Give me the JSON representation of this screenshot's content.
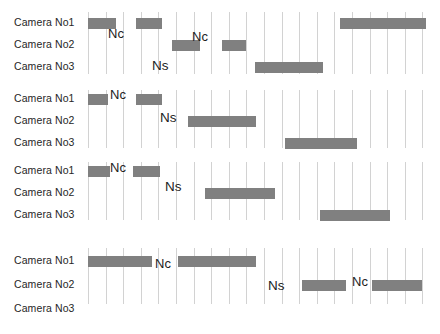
{
  "figure": {
    "row_labels": [
      "Camera No1",
      "Camera No2",
      "Camera No3"
    ],
    "bar_color": "#808080",
    "gridline_color": "#d2d2d2",
    "background_color": "#ffffff",
    "annotation_labels": {
      "nc": "Nc",
      "ns": "Ns"
    }
  },
  "chart_data": {
    "type": "bar",
    "title": "",
    "xlabel": "",
    "ylabel": "",
    "categories": [
      "Camera No1",
      "Camera No2",
      "Camera No3"
    ],
    "legend": [],
    "grid": "vertical-only",
    "axis_note": "Horizontal axis is time; vertical gridlines mark uniform time ticks (~17.5 px apart).",
    "blocks": [
      {
        "id": "block-1",
        "segments": [
          {
            "row": 0,
            "x": 88,
            "w": 28,
            "label": ""
          },
          {
            "row": 0,
            "x": 136,
            "w": 26,
            "label": ""
          },
          {
            "row": 0,
            "x": 340,
            "w": 86,
            "label": ""
          },
          {
            "row": 1,
            "x": 172,
            "w": 28,
            "label": ""
          },
          {
            "row": 1,
            "x": 222,
            "w": 24,
            "label": ""
          },
          {
            "row": 2,
            "x": 255,
            "w": 68,
            "label": ""
          }
        ],
        "notes": [
          {
            "text": "Nc",
            "x": 108,
            "y": 27
          },
          {
            "text": "Nc",
            "x": 192,
            "y": 30
          },
          {
            "text": "Ns",
            "x": 152,
            "y": 59
          }
        ]
      },
      {
        "id": "block-2",
        "segments": [
          {
            "row": 0,
            "x": 88,
            "w": 20,
            "label": ""
          },
          {
            "row": 0,
            "x": 136,
            "w": 26,
            "label": ""
          },
          {
            "row": 1,
            "x": 188,
            "w": 68,
            "label": ""
          },
          {
            "row": 2,
            "x": 285,
            "w": 72,
            "label": ""
          }
        ],
        "notes": [
          {
            "text": "Nc",
            "x": 110,
            "y": 88
          },
          {
            "text": "Ns",
            "x": 160,
            "y": 111
          }
        ]
      },
      {
        "id": "block-3",
        "segments": [
          {
            "row": 0,
            "x": 88,
            "w": 22,
            "label": ""
          },
          {
            "row": 0,
            "x": 133,
            "w": 27,
            "label": ""
          },
          {
            "row": 1,
            "x": 205,
            "w": 70,
            "label": ""
          },
          {
            "row": 2,
            "x": 320,
            "w": 70,
            "label": ""
          }
        ],
        "notes": [
          {
            "text": "Nc",
            "x": 110,
            "y": 161
          },
          {
            "text": "Ns",
            "x": 165,
            "y": 180
          }
        ]
      },
      {
        "id": "block-4",
        "segments": [
          {
            "row": 0,
            "x": 88,
            "w": 64,
            "label": ""
          },
          {
            "row": 0,
            "x": 178,
            "w": 78,
            "label": ""
          },
          {
            "row": 1,
            "x": 302,
            "w": 44,
            "label": ""
          },
          {
            "row": 1,
            "x": 372,
            "w": 50,
            "label": ""
          }
        ],
        "notes": [
          {
            "text": "Nc",
            "x": 155,
            "y": 257
          },
          {
            "text": "Ns",
            "x": 268,
            "y": 279
          },
          {
            "text": "Nc",
            "x": 352,
            "y": 275
          }
        ]
      }
    ]
  }
}
